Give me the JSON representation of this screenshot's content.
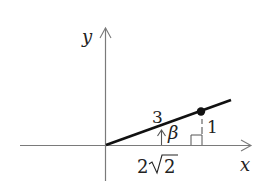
{
  "diagram": {
    "type": "coordinate-triangle",
    "axes": {
      "x_label": "x",
      "y_label": "y"
    },
    "labels": {
      "hypotenuse": "3",
      "angle": "β",
      "opposite": "1",
      "adjacent_coef": "2",
      "adjacent_radicand": "2",
      "adjacent_full": "2√2"
    },
    "colors": {
      "axis": "#7a7a7a",
      "ray": "#111111",
      "text": "#222222"
    }
  }
}
